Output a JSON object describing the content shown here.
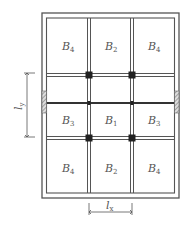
{
  "diagram": {
    "type": "slab-panel-layout",
    "panels": [
      {
        "row": 0,
        "col": 0,
        "label": "B",
        "sub": "4"
      },
      {
        "row": 0,
        "col": 1,
        "label": "B",
        "sub": "2"
      },
      {
        "row": 0,
        "col": 2,
        "label": "B",
        "sub": "4"
      },
      {
        "row": 1,
        "col": 0,
        "label": "B",
        "sub": "3"
      },
      {
        "row": 1,
        "col": 1,
        "label": "B",
        "sub": "1"
      },
      {
        "row": 1,
        "col": 2,
        "label": "B",
        "sub": "3"
      },
      {
        "row": 2,
        "col": 0,
        "label": "B",
        "sub": "4"
      },
      {
        "row": 2,
        "col": 1,
        "label": "B",
        "sub": "2"
      },
      {
        "row": 2,
        "col": 2,
        "label": "B",
        "sub": "4"
      }
    ],
    "dimensions": {
      "ly": {
        "label": "l",
        "sub": "y"
      },
      "lx": {
        "label": "l",
        "sub": "x"
      }
    },
    "colors": {
      "line": "#555555",
      "column": "#222222",
      "hatch": "#888888"
    }
  }
}
